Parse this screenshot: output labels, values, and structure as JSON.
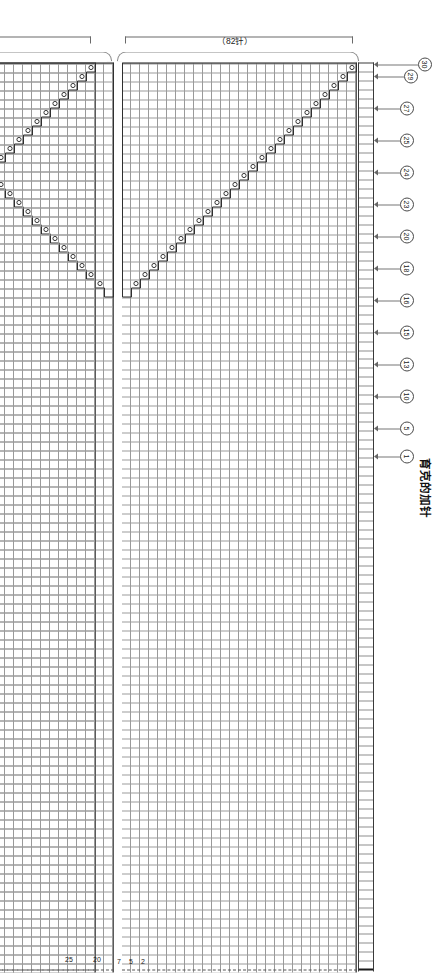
{
  "figure": {
    "title": "育克的加针",
    "orientation_note": "landscape chart presented rotated in a portrait frame"
  },
  "row_markers": [
    {
      "label": "30"
    },
    {
      "label": "29"
    },
    {
      "label": "27"
    },
    {
      "label": "25"
    },
    {
      "label": "24"
    },
    {
      "label": "23"
    },
    {
      "label": "20"
    },
    {
      "label": "18"
    },
    {
      "label": "16"
    },
    {
      "label": "15"
    },
    {
      "label": "13"
    },
    {
      "label": "10"
    },
    {
      "label": "5"
    },
    {
      "label": "1"
    }
  ],
  "sections": [
    {
      "id": "back",
      "name": "后身片",
      "stitch_count_label": "（82针）",
      "inner_row_numbers": [
        "2",
        "5",
        "7"
      ]
    },
    {
      "id": "middle",
      "name": "",
      "stitch_count_label": "",
      "inner_row_numbers": [
        "20",
        "25",
        "30"
      ]
    },
    {
      "id": "left_sleeve",
      "name": "左袖",
      "stitch_count_label": "（89针）",
      "inner_row_numbers": [
        "2",
        "5",
        "7"
      ]
    }
  ],
  "legend": {
    "symbol_label": "−",
    "equals_label": "=",
    "blank_label": ""
  },
  "colors": {
    "ink": "#1a1a1a",
    "grid": "#9a9a9a",
    "rule": "#5a5a5a",
    "dash": "#555555",
    "paper": "#ffffff"
  }
}
